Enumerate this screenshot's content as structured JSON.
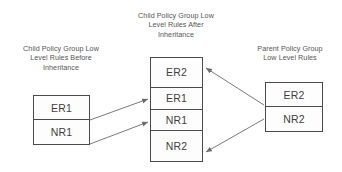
{
  "diagram": {
    "background_color": "#ffffff",
    "border_color": "#4a4a4a",
    "text_color": "#3f3f3f",
    "caption_color": "#555555",
    "arrow_color": "#6b6b6b"
  },
  "captions": {
    "left": "Child Policy Group Low\nLevel Rules Before\nInheritance",
    "middle": "Child Policy Group Low\nLevel Rules After\nInheritance",
    "right": "Parent Policy Group\nLow Level Rules"
  },
  "boxes": {
    "left": {
      "name": "child-before-inheritance",
      "cells": [
        {
          "label": "ER1"
        },
        {
          "label": "NR1"
        }
      ]
    },
    "middle": {
      "name": "child-after-inheritance",
      "cells": [
        {
          "label": "ER2"
        },
        {
          "label": "ER1"
        },
        {
          "label": "NR1"
        },
        {
          "label": "NR2"
        }
      ]
    },
    "right": {
      "name": "parent-rules",
      "cells": [
        {
          "label": "ER2"
        },
        {
          "label": "NR2"
        }
      ]
    }
  },
  "arrows": [
    {
      "name": "arrow-left-er1-to-middle-er1",
      "from": "left.ER1",
      "to": "middle.ER1"
    },
    {
      "name": "arrow-left-nr1-to-middle-nr1",
      "from": "left.NR1",
      "to": "middle.NR1"
    },
    {
      "name": "arrow-right-er2-to-middle-er2",
      "from": "right.ER2",
      "to": "middle.ER2"
    },
    {
      "name": "arrow-right-nr2-to-middle-nr2",
      "from": "right.NR2",
      "to": "middle.NR2"
    }
  ]
}
